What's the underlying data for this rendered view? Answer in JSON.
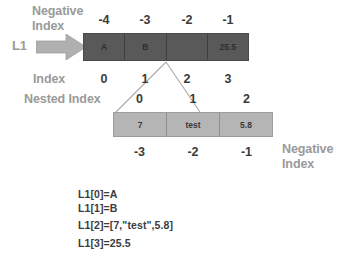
{
  "labels": {
    "negative_index_top_line1": "Negative",
    "negative_index_top_line2": "Index",
    "variable_name": "L1",
    "index_label": "Index",
    "nested_index_label": "Nested Index",
    "negative_index_bottom_line1": "Negative",
    "negative_index_bottom_line2": "Index"
  },
  "outer_list": {
    "negative_indices": [
      "-4",
      "-3",
      "-2",
      "-1"
    ],
    "positive_indices": [
      "0",
      "1",
      "2",
      "3"
    ],
    "cells": [
      "A",
      "B",
      "",
      "25.5"
    ],
    "fill_color": "#595959"
  },
  "nested_list": {
    "indices": [
      "0",
      "1",
      "2"
    ],
    "negative_indices": [
      "-3",
      "-2",
      "-1"
    ],
    "cells": [
      "7",
      "test",
      "5.8"
    ],
    "fill_color": "#b5b5b5"
  },
  "code_lines": [
    "L1[0]=A",
    "L1[1]=B",
    "L1[2]=[7,\"test\",5.8]",
    "L1[3]=25.5"
  ],
  "colors": {
    "label_grey": "#9a9a9a",
    "number_dark": "#3a3a3a",
    "outer_bar": "#595959",
    "nested_bar": "#b5b5b5",
    "arrow": "#b0b0b0"
  }
}
